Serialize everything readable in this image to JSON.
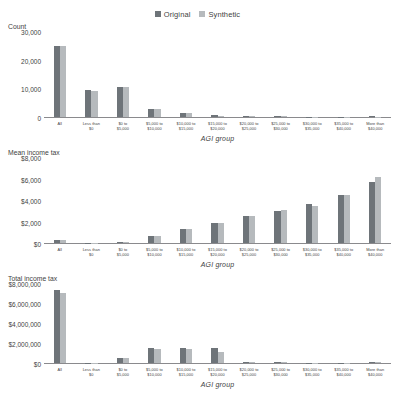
{
  "legend": {
    "items": [
      {
        "label": "Original",
        "color": "#6e7479",
        "icon": "square-swatch"
      },
      {
        "label": "Synthetic",
        "color": "#b6babd",
        "icon": "square-swatch"
      }
    ]
  },
  "xlabels": [
    "All",
    "Less than\n$0",
    "$0 to\n$5,000",
    "$5,000 to\n$10,000",
    "$10,000 to\n$15,000",
    "$15,000 to\n$20,000",
    "$20,000 to\n$25,000",
    "$25,000 to\n$30,000",
    "$30,000 to\n$35,000",
    "$35,000 to\n$40,000",
    "More than\n$40,000"
  ],
  "xtitle": "AGI group",
  "charts": [
    {
      "ylabel": "Count",
      "yticks": [
        "30,000",
        "20,000",
        "10,000",
        "0"
      ]
    },
    {
      "ylabel": "Mean income tax",
      "yticks": [
        "$8,000",
        "$6,000",
        "$4,000",
        "$2,000",
        "$0"
      ]
    },
    {
      "ylabel": "Total income tax",
      "yticks": [
        "$8,000,000",
        "$6,000,000",
        "$4,000,000",
        "$2,000,000",
        "$0"
      ]
    }
  ],
  "chart_data": [
    {
      "type": "bar",
      "title": "Count",
      "xlabel": "AGI group",
      "ylabel": "Count",
      "ylim": [
        0,
        30000
      ],
      "yticks": [
        0,
        10000,
        20000,
        30000
      ],
      "grid": false,
      "legend_position": "top-center",
      "categories": [
        "All",
        "Less than $0",
        "$0 to $5,000",
        "$5,000 to $10,000",
        "$10,000 to $15,000",
        "$15,000 to $20,000",
        "$20,000 to $25,000",
        "$25,000 to $30,000",
        "$30,000 to $35,000",
        "$35,000 to $40,000",
        "More than $40,000"
      ],
      "series": [
        {
          "name": "Original",
          "values": [
            25000,
            9500,
            10500,
            3000,
            1500,
            800,
            400,
            250,
            180,
            120,
            200
          ]
        },
        {
          "name": "Synthetic",
          "values": [
            25000,
            9300,
            10500,
            3000,
            1300,
            500,
            350,
            220,
            150,
            110,
            180
          ]
        }
      ]
    },
    {
      "type": "bar",
      "title": "Mean income tax",
      "xlabel": "AGI group",
      "ylabel": "Mean income tax",
      "ylim": [
        0,
        8000
      ],
      "yticks": [
        0,
        2000,
        4000,
        6000,
        8000
      ],
      "grid": false,
      "legend_position": "top-center",
      "categories": [
        "All",
        "Less than $0",
        "$0 to $5,000",
        "$5,000 to $10,000",
        "$10,000 to $15,000",
        "$15,000 to $20,000",
        "$20,000 to $25,000",
        "$25,000 to $30,000",
        "$30,000 to $35,000",
        "$35,000 to $40,000",
        "More than $40,000"
      ],
      "series": [
        {
          "name": "Original",
          "values": [
            320,
            10,
            60,
            700,
            1300,
            1900,
            2500,
            3050,
            3650,
            4500,
            5700
          ]
        },
        {
          "name": "Synthetic",
          "values": [
            300,
            10,
            50,
            620,
            1350,
            1850,
            2500,
            3150,
            3500,
            4550,
            6200
          ]
        }
      ]
    },
    {
      "type": "bar",
      "title": "Total income tax",
      "xlabel": "AGI group",
      "ylabel": "Total income tax",
      "ylim": [
        0,
        8000000
      ],
      "yticks": [
        0,
        2000000,
        4000000,
        6000000,
        8000000
      ],
      "grid": false,
      "legend_position": "top-center",
      "categories": [
        "All",
        "Less than $0",
        "$0 to $5,000",
        "$5,000 to $10,000",
        "$10,000 to $15,000",
        "$15,000 to $20,000",
        "$20,000 to $25,000",
        "$25,000 to $30,000",
        "$30,000 to $35,000",
        "$35,000 to $40,000",
        "More than $40,000"
      ],
      "series": [
        {
          "name": "Original",
          "values": [
            7400000,
            20000,
            500000,
            1500000,
            1500000,
            1500000,
            140000,
            60000,
            40000,
            30000,
            60000
          ]
        },
        {
          "name": "Synthetic",
          "values": [
            7100000,
            20000,
            480000,
            1450000,
            1400000,
            1150000,
            120000,
            55000,
            35000,
            28000,
            55000
          ]
        }
      ]
    }
  ]
}
